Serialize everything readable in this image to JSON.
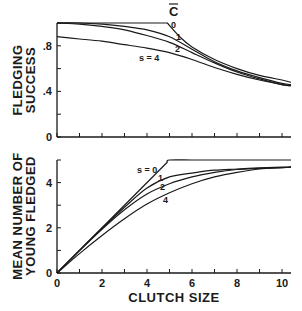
{
  "chart_data": [
    {
      "type": "line",
      "title": "",
      "xlabel": "",
      "ylabel": "FLEDGING SUCCESS",
      "ylabel_lines": [
        "FLEDGING",
        "SUCCESS"
      ],
      "xlim": [
        0,
        10.4
      ],
      "ylim": [
        0,
        1.0
      ],
      "yticks": [
        0,
        0.2,
        0.4,
        0.6,
        0.8,
        1.0
      ],
      "ytick_labels": [
        {
          "value": 0,
          "label": "0"
        },
        {
          "value": 0.4,
          "label": ".4"
        },
        {
          "value": 0.8,
          "label": ".8"
        }
      ],
      "xticks": [
        0,
        1,
        2,
        3,
        4,
        5,
        6,
        7,
        8,
        9,
        10
      ],
      "grid": false,
      "annotations": [
        {
          "text": "C̄",
          "x": 5.1,
          "y": 1.08
        }
      ],
      "series": [
        {
          "name": "s = 0",
          "label": "0",
          "x": [
            0,
            1,
            2,
            3,
            4,
            4.9,
            5.5,
            6,
            7,
            8,
            9,
            10,
            10.4
          ],
          "y": [
            1.0,
            1.0,
            1.0,
            1.0,
            1.0,
            1.0,
            0.87,
            0.79,
            0.68,
            0.6,
            0.54,
            0.5,
            0.48
          ]
        },
        {
          "name": "s = 1",
          "label": "1",
          "x": [
            0,
            1,
            2,
            3,
            4,
            5,
            6,
            7,
            8,
            9,
            10,
            10.4
          ],
          "y": [
            1.0,
            1.0,
            0.99,
            0.97,
            0.94,
            0.88,
            0.77,
            0.66,
            0.58,
            0.52,
            0.47,
            0.46
          ]
        },
        {
          "name": "s = 2",
          "label": "2",
          "x": [
            0,
            1,
            2,
            3,
            4,
            5,
            6,
            7,
            8,
            9,
            10,
            10.4
          ],
          "y": [
            1.0,
            0.99,
            0.97,
            0.94,
            0.89,
            0.83,
            0.74,
            0.65,
            0.57,
            0.51,
            0.46,
            0.45
          ]
        },
        {
          "name": "s = 4",
          "label": "s = 4",
          "x": [
            0,
            1,
            2,
            3,
            4,
            5,
            6,
            7,
            8,
            9,
            10,
            10.4
          ],
          "y": [
            0.88,
            0.86,
            0.84,
            0.81,
            0.78,
            0.74,
            0.68,
            0.61,
            0.55,
            0.5,
            0.46,
            0.45
          ]
        }
      ]
    },
    {
      "type": "line",
      "title": "",
      "xlabel": "CLUTCH SIZE",
      "ylabel": "MEAN NUMBER OF YOUNG FLEDGED",
      "ylabel_lines": [
        "MEAN NUMBER OF",
        "YOUNG FLEDGED"
      ],
      "xlim": [
        0,
        10.4
      ],
      "ylim": [
        0,
        5
      ],
      "yticks": [
        0,
        1,
        2,
        3,
        4,
        5
      ],
      "ytick_labels": [
        {
          "value": 0,
          "label": "0"
        },
        {
          "value": 2,
          "label": "2"
        },
        {
          "value": 4,
          "label": "4"
        }
      ],
      "xticks": [
        0,
        1,
        2,
        3,
        4,
        5,
        6,
        7,
        8,
        9,
        10
      ],
      "xtick_labels": [
        {
          "value": 0,
          "label": "0"
        },
        {
          "value": 2,
          "label": "2"
        },
        {
          "value": 4,
          "label": "4"
        },
        {
          "value": 6,
          "label": "6"
        },
        {
          "value": 8,
          "label": "8"
        },
        {
          "value": 10,
          "label": "10"
        }
      ],
      "grid": false,
      "series": [
        {
          "name": "s = 0",
          "label": "s = 0",
          "x": [
            0,
            4.9,
            5,
            6,
            7,
            8,
            9,
            10,
            10.4
          ],
          "y": [
            0,
            4.9,
            5.0,
            5.0,
            5.0,
            5.0,
            5.0,
            5.0,
            5.0
          ]
        },
        {
          "name": "s = 1",
          "label": "1",
          "x": [
            0,
            1,
            2,
            3,
            4,
            5,
            6,
            7,
            8,
            9,
            10,
            10.4
          ],
          "y": [
            0,
            1.0,
            1.98,
            2.91,
            3.76,
            4.25,
            4.42,
            4.55,
            4.6,
            4.65,
            4.68,
            4.7
          ]
        },
        {
          "name": "s = 2",
          "label": "2",
          "x": [
            0,
            1,
            2,
            3,
            4,
            5,
            6,
            7,
            8,
            9,
            10,
            10.4
          ],
          "y": [
            0,
            0.99,
            1.94,
            2.8,
            3.5,
            3.95,
            4.25,
            4.45,
            4.58,
            4.63,
            4.66,
            4.68
          ]
        },
        {
          "name": "s = 4",
          "label": "4",
          "x": [
            0,
            1,
            2,
            3,
            4,
            5,
            6,
            7,
            8,
            9,
            10,
            10.4
          ],
          "y": [
            0,
            0.86,
            1.66,
            2.4,
            3.05,
            3.55,
            3.95,
            4.25,
            4.45,
            4.6,
            4.66,
            4.68
          ]
        }
      ]
    }
  ]
}
